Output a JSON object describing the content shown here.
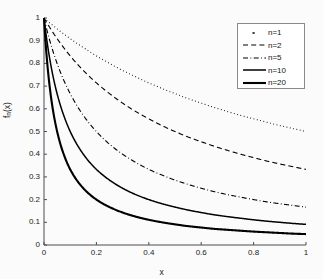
{
  "chart_data": {
    "type": "line",
    "title": "",
    "xlabel": "x",
    "ylabel": "f_n(x)",
    "xlim": [
      0,
      1
    ],
    "ylim": [
      0,
      1
    ],
    "grid": false,
    "legend_position": "top-right",
    "xticks": [
      "0",
      "0.2",
      "0.4",
      "0.6",
      "0.8",
      "1"
    ],
    "xtick_values": [
      0,
      0.2,
      0.4,
      0.6,
      0.8,
      1
    ],
    "yticks": [
      "0",
      "0.1",
      "0.2",
      "0.3",
      "0.4",
      "0.5",
      "0.6",
      "0.7",
      "0.8",
      "0.9",
      "1"
    ],
    "ytick_values": [
      0,
      0.1,
      0.2,
      0.3,
      0.4,
      0.5,
      0.6,
      0.7,
      0.8,
      0.9,
      1
    ],
    "x": [
      0,
      0.02,
      0.04,
      0.06,
      0.08,
      0.1,
      0.15,
      0.2,
      0.25,
      0.3,
      0.35,
      0.4,
      0.45,
      0.5,
      0.55,
      0.6,
      0.65,
      0.7,
      0.75,
      0.8,
      0.85,
      0.9,
      0.95,
      1
    ],
    "series": [
      {
        "name": "n=1",
        "n": 1,
        "style": "dotted",
        "color": "#000000",
        "width": 1.1,
        "values": [
          1,
          0.98,
          0.962,
          0.943,
          0.926,
          0.909,
          0.87,
          0.833,
          0.8,
          0.769,
          0.741,
          0.714,
          0.69,
          0.667,
          0.645,
          0.625,
          0.606,
          0.588,
          0.571,
          0.556,
          0.541,
          0.526,
          0.513,
          0.5
        ]
      },
      {
        "name": "n=2",
        "n": 2,
        "style": "dashed",
        "color": "#000000",
        "width": 1.1,
        "values": [
          1,
          0.962,
          0.926,
          0.893,
          0.862,
          0.833,
          0.769,
          0.714,
          0.667,
          0.625,
          0.588,
          0.556,
          0.526,
          0.5,
          0.476,
          0.455,
          0.435,
          0.417,
          0.4,
          0.385,
          0.37,
          0.357,
          0.345,
          0.333
        ]
      },
      {
        "name": "n=5",
        "n": 5,
        "style": "dashdot",
        "color": "#000000",
        "width": 1.1,
        "values": [
          1,
          0.909,
          0.833,
          0.769,
          0.714,
          0.667,
          0.571,
          0.5,
          0.444,
          0.4,
          0.364,
          0.333,
          0.308,
          0.286,
          0.267,
          0.25,
          0.235,
          0.222,
          0.211,
          0.2,
          0.19,
          0.182,
          0.174,
          0.167
        ]
      },
      {
        "name": "n=10",
        "n": 10,
        "style": "solid",
        "color": "#000000",
        "width": 1.5,
        "values": [
          1,
          0.833,
          0.714,
          0.625,
          0.556,
          0.5,
          0.4,
          0.333,
          0.286,
          0.25,
          0.222,
          0.2,
          0.182,
          0.167,
          0.154,
          0.143,
          0.133,
          0.125,
          0.118,
          0.111,
          0.105,
          0.1,
          0.095,
          0.091
        ]
      },
      {
        "name": "n=20",
        "n": 20,
        "style": "solid",
        "color": "#000000",
        "width": 2.1,
        "values": [
          1,
          0.714,
          0.556,
          0.455,
          0.385,
          0.333,
          0.25,
          0.2,
          0.167,
          0.143,
          0.125,
          0.111,
          0.1,
          0.091,
          0.083,
          0.077,
          0.071,
          0.067,
          0.063,
          0.059,
          0.056,
          0.053,
          0.05,
          0.048
        ]
      }
    ]
  },
  "legend": {
    "entries": [
      {
        "label": "n=1"
      },
      {
        "label": "n=2"
      },
      {
        "label": "n=5"
      },
      {
        "label": "n=10"
      },
      {
        "label": "n=20"
      }
    ]
  }
}
